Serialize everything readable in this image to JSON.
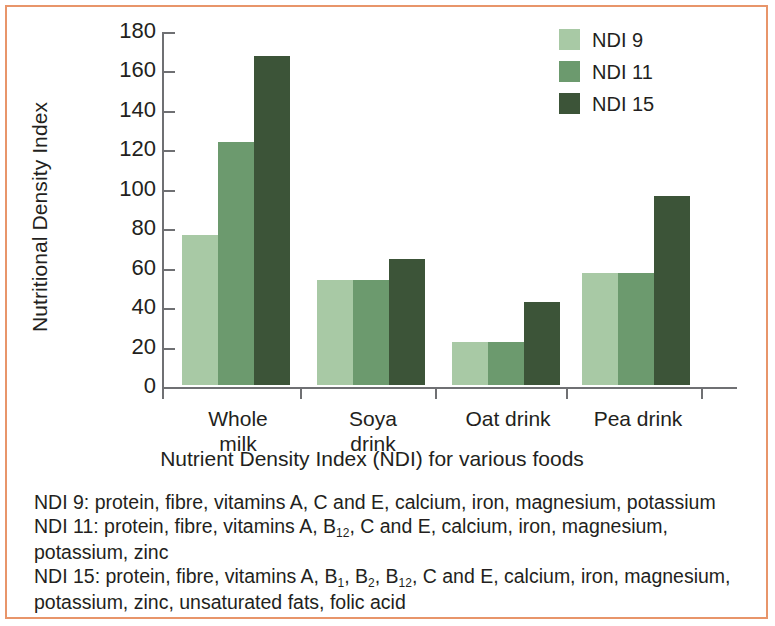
{
  "figure": {
    "border_color": "#e8956a",
    "background": "#ffffff"
  },
  "chart_data": {
    "type": "bar",
    "title": "",
    "xlabel": "Nutrient Density Index (NDI) for various foods",
    "ylabel": "Nutritional Density Index",
    "categories": [
      "Whole milk",
      "Soya drink",
      "Oat drink",
      "Pea drink"
    ],
    "category_lines": [
      [
        "Whole",
        "milk"
      ],
      [
        "Soya",
        "drink"
      ],
      [
        "Oat drink"
      ],
      [
        "Pea drink"
      ]
    ],
    "series": [
      {
        "name": "NDI 9",
        "color": "#a8c9a5",
        "values": [
          76,
          53,
          22,
          57
        ]
      },
      {
        "name": "NDI 11",
        "color": "#6c9a6e",
        "values": [
          123,
          53,
          22,
          57
        ]
      },
      {
        "name": "NDI 15",
        "color": "#3c5438",
        "values": [
          167,
          64,
          42,
          96
        ]
      }
    ],
    "ylim": [
      0,
      180
    ],
    "yticks": [
      0,
      20,
      40,
      60,
      80,
      100,
      120,
      140,
      160,
      180
    ],
    "ytick_labels": [
      "0",
      "20",
      "40",
      "60",
      "80",
      "100",
      "120",
      "140",
      "160",
      "180"
    ],
    "grid": false,
    "legend_position": "top-right"
  },
  "legend": {
    "items": [
      {
        "label": "NDI 9",
        "color": "#a8c9a5"
      },
      {
        "label": "NDI 11",
        "color": "#6c9a6e"
      },
      {
        "label": "NDI 15",
        "color": "#3c5438"
      }
    ]
  },
  "footnote": {
    "line1_prefix": "NDI 9: protein, fibre, vitamins A, C and E, calcium, iron, magnesium, potassium",
    "line2_a": "NDI 11: protein, fibre, vitamins A, B",
    "line2_sub1": "12",
    "line2_b": ", C and E, calcium, iron, magnesium, potassium, zinc",
    "line3_a": "NDI 15: protein, fibre, vitamins A, B",
    "line3_sub1": "1",
    "line3_b": ", B",
    "line3_sub2": "2",
    "line3_c": ", B",
    "line3_sub3": "12",
    "line3_d": ", C and E, calcium, iron, magnesium, potassium, zinc, unsaturated fats, folic acid"
  }
}
